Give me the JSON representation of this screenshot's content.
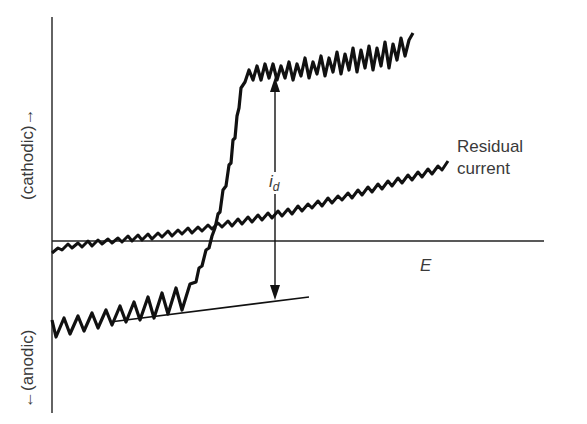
{
  "diagram": {
    "type": "polarogram",
    "y_axis": {
      "positive_label": "(cathodic)→",
      "negative_label": "←(anodic)"
    },
    "x_axis": {
      "label": "E"
    },
    "annotations": {
      "residual_current_line1": "Residual",
      "residual_current_line2": "current",
      "diffusion_current_symbol": "i",
      "diffusion_current_subscript": "d"
    },
    "colors": {
      "ink": "#111111",
      "text": "#3a3a3a",
      "background": "#ffffff"
    }
  }
}
